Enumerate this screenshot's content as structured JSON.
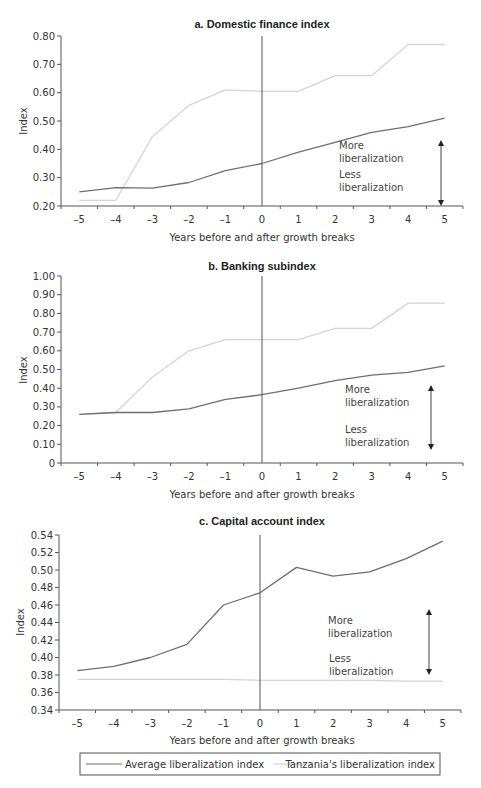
{
  "chart_data": [
    {
      "type": "line",
      "title": "a. Domestic finance index",
      "xlabel": "Years before and after growth breaks",
      "ylabel": "Index",
      "x": [
        -5,
        -4,
        -3,
        -2,
        -1,
        0,
        1,
        2,
        3,
        4,
        5
      ],
      "x_tick_labels": [
        "–5",
        "–4",
        "–3",
        "–2",
        "–1",
        "0",
        "1",
        "2",
        "3",
        "4",
        "5"
      ],
      "y_ticks": [
        0.2,
        0.3,
        0.4,
        0.5,
        0.6,
        0.7,
        0.8
      ],
      "y_tick_labels": [
        "0.20",
        "0.30",
        "0.40",
        "0.50",
        "0.60",
        "0.70",
        "0.80"
      ],
      "ylim": [
        0.2,
        0.8
      ],
      "grid": false,
      "reference_line_x": 0,
      "series": [
        {
          "name": "Average liberalization index",
          "color": "#6e6e6e",
          "values": [
            0.25,
            0.265,
            0.263,
            0.283,
            0.325,
            0.35,
            0.39,
            0.425,
            0.46,
            0.48,
            0.51
          ]
        },
        {
          "name": "Tanzania's liberalization index",
          "color": "#d4d4d4",
          "values": [
            0.22,
            0.22,
            0.445,
            0.555,
            0.61,
            0.605,
            0.605,
            0.66,
            0.66,
            0.77,
            0.77
          ]
        }
      ],
      "annotations": {
        "more": [
          "More",
          "liberalization"
        ],
        "less": [
          "Less",
          "liberalization"
        ]
      }
    },
    {
      "type": "line",
      "title": "b. Banking subindex",
      "xlabel": "Years before and after growth breaks",
      "ylabel": "Index",
      "x": [
        -5,
        -4,
        -3,
        -2,
        -1,
        0,
        1,
        2,
        3,
        4,
        5
      ],
      "x_tick_labels": [
        "–5",
        "–4",
        "–3",
        "–2",
        "–1",
        "0",
        "1",
        "2",
        "3",
        "4",
        "5"
      ],
      "y_ticks": [
        0,
        0.1,
        0.2,
        0.3,
        0.4,
        0.5,
        0.6,
        0.7,
        0.8,
        0.9,
        1.0
      ],
      "y_tick_labels": [
        "0",
        "0.10",
        "0.20",
        "0.30",
        "0.40",
        "0.50",
        "0.60",
        "0.70",
        "0.80",
        "0.90",
        "1.00"
      ],
      "ylim": [
        0,
        1.0
      ],
      "grid": false,
      "reference_line_x": 0,
      "series": [
        {
          "name": "Average liberalization index",
          "color": "#6e6e6e",
          "values": [
            0.26,
            0.27,
            0.27,
            0.29,
            0.34,
            0.365,
            0.4,
            0.44,
            0.47,
            0.485,
            0.52
          ]
        },
        {
          "name": "Tanzania's liberalization index",
          "color": "#d4d4d4",
          "values": [
            0.26,
            0.27,
            0.46,
            0.6,
            0.66,
            0.66,
            0.66,
            0.72,
            0.72,
            0.855,
            0.855
          ]
        }
      ],
      "annotations": {
        "more": [
          "More",
          "liberalization"
        ],
        "less": [
          "Less",
          "liberalization"
        ]
      }
    },
    {
      "type": "line",
      "title": "c. Capital account index",
      "xlabel": "Years before and after growth breaks",
      "ylabel": "Index",
      "x": [
        -5,
        -4,
        -3,
        -2,
        -1,
        0,
        1,
        2,
        3,
        4,
        5
      ],
      "x_tick_labels": [
        "–5",
        "–4",
        "–3",
        "–2",
        "–1",
        "0",
        "1",
        "2",
        "3",
        "4",
        "5"
      ],
      "y_ticks": [
        0.34,
        0.36,
        0.38,
        0.4,
        0.42,
        0.44,
        0.46,
        0.48,
        0.5,
        0.52,
        0.54
      ],
      "y_tick_labels": [
        "0.34",
        "0.36",
        "0.38",
        "0.40",
        "0.42",
        "0.44",
        "0.46",
        "0.48",
        "0.50",
        "0.52",
        "0.54"
      ],
      "ylim": [
        0.34,
        0.54
      ],
      "grid": false,
      "reference_line_x": 0,
      "series": [
        {
          "name": "Average liberalization index",
          "color": "#6e6e6e",
          "values": [
            0.385,
            0.39,
            0.4,
            0.415,
            0.46,
            0.474,
            0.503,
            0.493,
            0.498,
            0.513,
            0.533
          ]
        },
        {
          "name": "Tanzania's liberalization index",
          "color": "#d4d4d4",
          "values": [
            0.375,
            0.375,
            0.375,
            0.375,
            0.375,
            0.374,
            0.374,
            0.374,
            0.374,
            0.373,
            0.373
          ]
        }
      ],
      "annotations": {
        "more": [
          "More",
          "liberalization"
        ],
        "less": [
          "Less",
          "liberalization"
        ]
      }
    }
  ],
  "legend": {
    "position": "bottom",
    "items": [
      {
        "label": "Average liberalization index",
        "color": "#6e6e6e"
      },
      {
        "label": "Tanzania's liberalization index",
        "color": "#d4d4d4"
      }
    ]
  }
}
